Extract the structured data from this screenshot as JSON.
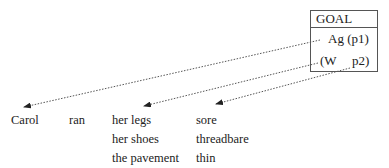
{
  "goal_box": {
    "title": "GOAL",
    "line1": "Ag (p1)",
    "line2_left": "(W",
    "line2_right": "p2)"
  },
  "sentence": {
    "col1": [
      "Carol"
    ],
    "col2": [
      "ran"
    ],
    "col3": [
      "her legs",
      "her shoes",
      "the pavement"
    ],
    "col4": [
      "sore",
      "threadbare",
      "thin"
    ]
  },
  "arrows": [
    {
      "from": "Ag (p1)",
      "to": "Carol",
      "style": "dotted"
    },
    {
      "from": "(W",
      "to": "her legs",
      "style": "dotted"
    },
    {
      "from": "p2)",
      "to": "sore",
      "style": "dotted"
    }
  ]
}
